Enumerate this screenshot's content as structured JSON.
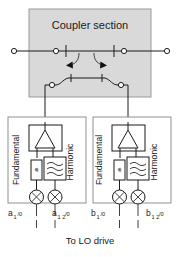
{
  "figure": {
    "type": "schematic-diagram",
    "domain": "rf-microwave-measurement",
    "caption_footer": "To LO drive"
  },
  "coupler": {
    "title": "Coupler section",
    "panel_fill": "#d9d9d9",
    "panel_stroke": "#9a9a9a",
    "through_line_ports": 2,
    "coupled_line_ports": 2,
    "series_capacitors": 2,
    "coupling_arrows": 2,
    "arrow_direction_left": "left",
    "arrow_direction_right": "right"
  },
  "channels": [
    {
      "id": "channel-a",
      "side": "left",
      "panel_fill": "#ffffff",
      "panel_stroke": "#8f8f8f",
      "splitter_label": "splitter-triangle",
      "path_labels": {
        "left": "Fundamental",
        "right": "Harmonic"
      },
      "attenuator_label": "dB",
      "filter_label": "filter-wave",
      "mixers": [
        {
          "name": "mixer-a1",
          "symbol": "circle-x",
          "port_base": "a",
          "port_sub": "1",
          "port_suffix": "/0"
        },
        {
          "name": "mixer-a12",
          "symbol": "circle-x",
          "port_base": "a",
          "port_sub": "1 2",
          "port_suffix": "/0"
        }
      ]
    },
    {
      "id": "channel-b",
      "side": "right",
      "panel_fill": "#ffffff",
      "panel_stroke": "#8f8f8f",
      "splitter_label": "splitter-triangle",
      "path_labels": {
        "left": "Fundamental",
        "right": "Harmonic"
      },
      "attenuator_label": "dB",
      "filter_label": "filter-wave",
      "mixers": [
        {
          "name": "mixer-b1",
          "symbol": "circle-x",
          "port_base": "b",
          "port_sub": "1",
          "port_suffix": "/0"
        },
        {
          "name": "mixer-b12",
          "symbol": "circle-x",
          "port_base": "b",
          "port_sub": "1 2",
          "port_suffix": "/0"
        }
      ]
    }
  ],
  "colors": {
    "ink": "#1b1b1b",
    "panel_grey": "#d9d9d9",
    "panel_white": "#ffffff",
    "background": "#ffffff"
  }
}
